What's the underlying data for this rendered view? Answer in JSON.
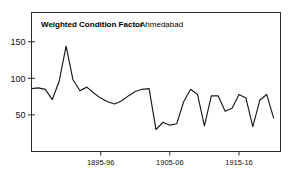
{
  "chart_data": {
    "type": "line",
    "title": "Weighted Condition Factor",
    "subtitle": "Ahmedabad",
    "xlabel": "",
    "ylabel": "",
    "grid": false,
    "legend": "none",
    "line_color": "#1a1a1a",
    "frame_color": "#2b2b2b",
    "background": "#ffffff",
    "ylim": [
      0,
      190
    ],
    "yticks": [
      50,
      100,
      150
    ],
    "ytick_labels": [
      "50",
      "100",
      "150"
    ],
    "xlim": [
      1885,
      1921
    ],
    "xticks": [
      1895,
      1905,
      1915
    ],
    "xtick_labels": [
      "1895-96",
      "1905-06",
      "1915-16"
    ],
    "x": [
      1885,
      1886,
      1887,
      1888,
      1889,
      1890,
      1891,
      1892,
      1893,
      1894,
      1895,
      1896,
      1897,
      1898,
      1899,
      1900,
      1901,
      1902,
      1903,
      1904,
      1905,
      1906,
      1907,
      1908,
      1909,
      1910,
      1911,
      1912,
      1913,
      1914,
      1915,
      1916,
      1917,
      1918,
      1919,
      1920
    ],
    "values": [
      86,
      87,
      85,
      71,
      96,
      144,
      98,
      83,
      88,
      80,
      73,
      68,
      65,
      69,
      76,
      82,
      85,
      86,
      30,
      40,
      36,
      38,
      68,
      85,
      78,
      35,
      76,
      76,
      55,
      59,
      78,
      73,
      34,
      70,
      78,
      46
    ]
  }
}
